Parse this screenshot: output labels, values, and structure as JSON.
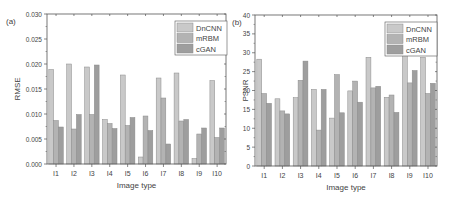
{
  "colors": {
    "DnCNN": "#c9c9c9",
    "mRBM": "#b3b3b3",
    "cGAN": "#9e9e9e",
    "bar_edge": "#8a8a8a",
    "axis": "#555555"
  },
  "chart_data": [
    {
      "panel_label": "(a)",
      "type": "bar",
      "title": "",
      "xlabel": "Image type",
      "ylabel": "RMSE",
      "ylim": [
        0,
        0.03
      ],
      "yticks": [
        "0.000",
        "0.005",
        "0.010",
        "0.015",
        "0.020",
        "0.025",
        "0.030"
      ],
      "grid": false,
      "legend_position": "top-right",
      "categories": [
        "I1",
        "I2",
        "I3",
        "I4",
        "I5",
        "I6",
        "I7",
        "I8",
        "I9",
        "I10"
      ],
      "series": [
        {
          "name": "DnCNN",
          "values": [
            0.0189,
            0.02,
            0.0194,
            0.0089,
            0.0178,
            0.0014,
            0.0172,
            0.0182,
            0.0011,
            0.0167
          ]
        },
        {
          "name": "mRBM",
          "values": [
            0.0087,
            0.007,
            0.0099,
            0.0081,
            0.0077,
            0.0096,
            0.0132,
            0.0086,
            0.006,
            0.0053
          ]
        },
        {
          "name": "cGAN",
          "values": [
            0.0074,
            0.0099,
            0.0198,
            0.0071,
            0.0093,
            0.0067,
            0.004,
            0.0089,
            0.0072,
            0.0072
          ]
        }
      ]
    },
    {
      "panel_label": "(b)",
      "type": "bar",
      "title": "",
      "xlabel": "Image type",
      "ylabel": "PSNR",
      "ylim": [
        0,
        40
      ],
      "yticks": [
        "0",
        "5",
        "10",
        "15",
        "20",
        "25",
        "30",
        "35",
        "40"
      ],
      "grid": false,
      "legend_position": "top-right",
      "categories": [
        "I1",
        "I2",
        "I3",
        "I4",
        "I5",
        "I6",
        "I7",
        "I8",
        "I9",
        "I10"
      ],
      "series": [
        {
          "name": "DnCNN",
          "values": [
            28.3,
            17.8,
            18.1,
            20.3,
            12.7,
            19.9,
            28.8,
            18.2,
            30.1,
            28.8
          ]
        },
        {
          "name": "mRBM",
          "values": [
            19.2,
            14.6,
            22.7,
            9.5,
            24.2,
            22.5,
            20.7,
            18.8,
            22.0,
            19.2
          ]
        },
        {
          "name": "cGAN",
          "values": [
            16.6,
            13.8,
            27.8,
            20.3,
            14.1,
            16.9,
            21.1,
            14.2,
            25.3,
            21.9
          ]
        }
      ]
    }
  ]
}
